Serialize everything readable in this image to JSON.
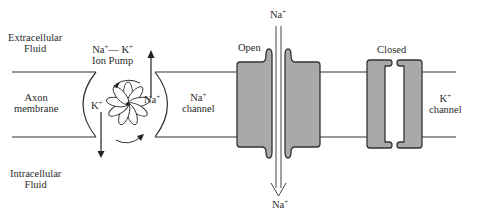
{
  "diagram": {
    "regions": {
      "extracellular": [
        "Extracellular",
        "Fluid"
      ],
      "intracellular": [
        "Intracellular",
        "Fluid"
      ],
      "membrane": [
        "Axon",
        "membrane"
      ]
    },
    "ion_pump": {
      "title_line1_a": "Na",
      "title_line1_sup_a": "+",
      "title_line1_dash": "— K",
      "title_line1_sup_b": "+",
      "title_line2": "Ion Pump",
      "k_label": "K",
      "k_sup": "+",
      "na_label": "Na",
      "na_sup": "+"
    },
    "na_channel": {
      "label_ion": "Na",
      "label_sup": "+",
      "label_word": "channel",
      "state": "Open",
      "top_ion": "Na",
      "top_sup": "+",
      "bottom_ion": "Na",
      "bottom_sup": "+"
    },
    "k_channel": {
      "label_ion": "K",
      "label_sup": "+",
      "label_word": "channel",
      "state": "Closed"
    },
    "colors": {
      "protein_fill": "#a9a9a9",
      "outline": "#333333",
      "background": "#ffffff"
    }
  }
}
